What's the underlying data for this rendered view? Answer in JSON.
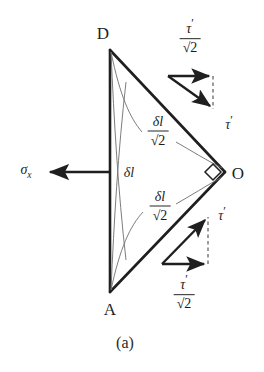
{
  "figure": {
    "caption": "(a)",
    "kind": "stress-element-diagram",
    "background_color": "#ffffff",
    "line_color": "#1f1f1f",
    "vertices": [
      {
        "name": "D",
        "label": "D",
        "x": 110,
        "y": 50
      },
      {
        "name": "A",
        "label": "A",
        "x": 110,
        "y": 292
      },
      {
        "name": "O",
        "label": "O",
        "x": 225,
        "y": 172
      }
    ],
    "vertex_labels": [
      {
        "name": "vertex-label-d",
        "text": "D",
        "x": 103,
        "y": 33
      },
      {
        "name": "vertex-label-a",
        "text": "A",
        "x": 110,
        "y": 309
      },
      {
        "name": "vertex-label-o",
        "text": "O",
        "x": 238,
        "y": 173
      }
    ],
    "right_angle_marker": {
      "name": "right-angle-marker-at-o",
      "x": 213,
      "y": 172,
      "size": 9
    },
    "applied_stress": {
      "name": "sigma-x-arrow",
      "symbol": "σ",
      "subscript": "x",
      "label_x": 26,
      "label_y": 172,
      "arrow_from_x": 110,
      "arrow_from_y": 172,
      "arrow_to_x": 46,
      "arrow_to_y": 172
    },
    "edge_labels": [
      {
        "name": "edge-label-delta-l",
        "numerator": "δl",
        "denominator": null,
        "x": 129,
        "y": 173
      },
      {
        "name": "edge-label-delta-l-over-root2-upper",
        "numerator": "δl",
        "denominator_sign": "√",
        "denominator_radicand": "2",
        "x": 158,
        "y": 131
      },
      {
        "name": "edge-label-delta-l-over-root2-lower",
        "numerator": "δl",
        "denominator_sign": "√",
        "denominator_radicand": "2",
        "x": 160,
        "y": 206
      }
    ],
    "shear_vector_diagrams": [
      {
        "name": "shear-triangle-upper",
        "origin_x": 168,
        "origin_y": 76,
        "horizontal_to_x": 213,
        "horizontal_to_y": 76,
        "diagonal_to_x": 213,
        "diagonal_to_y": 109,
        "dashed_from_x": 213,
        "dashed_from_y": 76,
        "dashed_to_x": 213,
        "dashed_to_y": 109,
        "horizontal_label": {
          "name": "label-tau-prime-over-root2-upper",
          "numerator": "τ",
          "numerator_prime": "′",
          "denominator_sign": "√",
          "denominator_radicand": "2",
          "x": 190,
          "y": 36
        },
        "diagonal_label": {
          "name": "label-tau-prime-upper",
          "text": "τ",
          "prime": "′",
          "x": 229,
          "y": 123
        }
      },
      {
        "name": "shear-triangle-lower",
        "origin_x": 162,
        "origin_y": 264,
        "horizontal_to_x": 208,
        "horizontal_to_y": 264,
        "diagonal_to_x": 208,
        "diagonal_to_y": 217,
        "dashed_from_x": 208,
        "dashed_from_y": 264,
        "dashed_to_x": 208,
        "dashed_to_y": 217,
        "horizontal_label": {
          "name": "label-tau-prime-over-root2-lower",
          "numerator": "τ",
          "numerator_prime": "′",
          "denominator_sign": "√",
          "denominator_radicand": "2",
          "x": 184,
          "y": 292
        },
        "diagonal_label": {
          "name": "label-tau-prime-lower",
          "text": "τ",
          "prime": "′",
          "x": 222,
          "y": 214
        }
      }
    ]
  }
}
